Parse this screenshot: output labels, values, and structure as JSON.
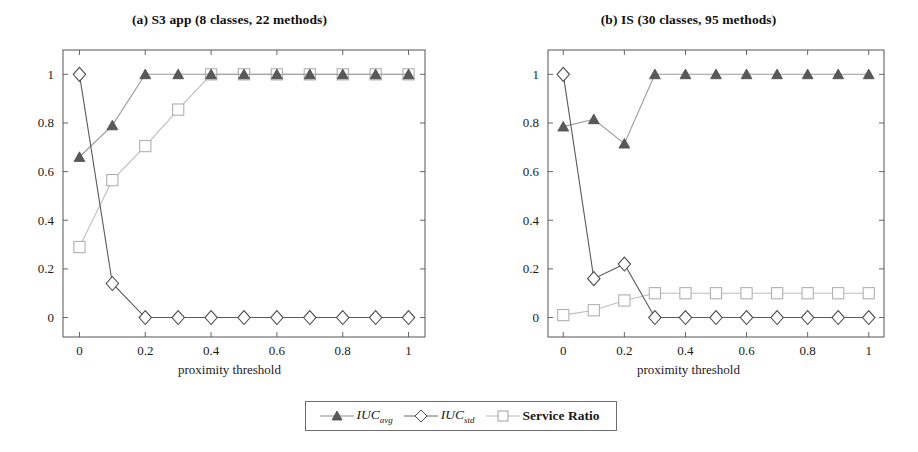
{
  "figure": {
    "x_axis_label": "proximity threshold"
  },
  "panels": [
    {
      "title": "(a) S3 app (8 classes, 22 methods)"
    },
    {
      "title": "(b) IS (30 classes, 95 methods)"
    }
  ],
  "legend": {
    "entries": [
      {
        "name": "iuc-avg",
        "label": "IUC",
        "sub": "avg",
        "marker": "filled-triangle-marker"
      },
      {
        "name": "iuc-std",
        "label": "IUC",
        "sub": "std",
        "marker": "open-diamond-marker"
      },
      {
        "name": "service-ratio",
        "label": "Service Ratio",
        "sub": "",
        "marker": "open-square-marker"
      }
    ]
  },
  "colors": {
    "triangle": "#595959",
    "diamond_line": "#4d4d4d",
    "square": "#b0b0b0",
    "triangle_line": "#9a9a9a",
    "axis": "#555555",
    "text": "#1a1a1a"
  },
  "chart_data": [
    {
      "type": "line",
      "title": "(a) S3 app (8 classes, 22 methods)",
      "xlabel": "proximity threshold",
      "ylabel": "",
      "xlim": [
        -0.05,
        1.05
      ],
      "ylim": [
        -0.08,
        1.1
      ],
      "xticks": [
        0,
        0.2,
        0.4,
        0.6,
        0.8,
        1
      ],
      "xticklabels": [
        "0",
        "0.2",
        "0.4",
        "0.6",
        "0.8",
        "1"
      ],
      "yticks": [
        0,
        0.2,
        0.4,
        0.6,
        0.8,
        1
      ],
      "yticklabels": [
        "0",
        "0.2",
        "0.4",
        "0.6",
        "0.8",
        "1"
      ],
      "grid": false,
      "legend_position": "bottom-center-shared",
      "x": [
        0,
        0.1,
        0.2,
        0.3,
        0.4,
        0.5,
        0.6,
        0.7,
        0.8,
        0.9,
        1
      ],
      "series": [
        {
          "name": "IUC_avg",
          "marker": "filled-triangle",
          "values": [
            0.66,
            0.79,
            1.0,
            1.0,
            1.0,
            1.0,
            1.0,
            1.0,
            1.0,
            1.0,
            1.0
          ]
        },
        {
          "name": "IUC_std",
          "marker": "open-diamond",
          "values": [
            1.0,
            0.14,
            0.0,
            0.0,
            0.0,
            0.0,
            0.0,
            0.0,
            0.0,
            0.0,
            0.0
          ]
        },
        {
          "name": "Service Ratio",
          "marker": "open-square",
          "values": [
            0.29,
            0.565,
            0.705,
            0.855,
            1.0,
            1.0,
            1.0,
            1.0,
            1.0,
            1.0,
            1.0
          ]
        }
      ]
    },
    {
      "type": "line",
      "title": "(b) IS (30 classes, 95 methods)",
      "xlabel": "proximity threshold",
      "ylabel": "",
      "xlim": [
        -0.05,
        1.05
      ],
      "ylim": [
        -0.08,
        1.1
      ],
      "xticks": [
        0,
        0.2,
        0.4,
        0.6,
        0.8,
        1
      ],
      "xticklabels": [
        "0",
        "0.2",
        "0.4",
        "0.6",
        "0.8",
        "1"
      ],
      "yticks": [
        0,
        0.2,
        0.4,
        0.6,
        0.8,
        1
      ],
      "yticklabels": [
        "0",
        "0.2",
        "0.4",
        "0.6",
        "0.8",
        "1"
      ],
      "grid": false,
      "legend_position": "bottom-center-shared",
      "x": [
        0,
        0.1,
        0.2,
        0.3,
        0.4,
        0.5,
        0.6,
        0.7,
        0.8,
        0.9,
        1
      ],
      "series": [
        {
          "name": "IUC_avg",
          "marker": "filled-triangle",
          "values": [
            0.785,
            0.815,
            0.715,
            1.0,
            1.0,
            1.0,
            1.0,
            1.0,
            1.0,
            1.0,
            1.0
          ]
        },
        {
          "name": "IUC_std",
          "marker": "open-diamond",
          "values": [
            1.0,
            0.16,
            0.22,
            0.0,
            0.0,
            0.0,
            0.0,
            0.0,
            0.0,
            0.0,
            0.0
          ]
        },
        {
          "name": "Service Ratio",
          "marker": "open-square",
          "values": [
            0.01,
            0.03,
            0.07,
            0.1,
            0.1,
            0.1,
            0.1,
            0.1,
            0.1,
            0.1,
            0.1
          ]
        }
      ]
    }
  ]
}
